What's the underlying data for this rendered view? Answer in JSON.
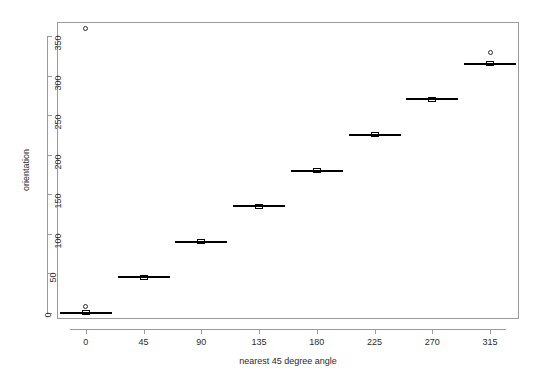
{
  "chart_data": {
    "type": "box",
    "title": "",
    "xlabel": "nearest 45 degree angle",
    "ylabel": "orientation",
    "categories": [
      "0",
      "45",
      "90",
      "135",
      "180",
      "225",
      "270",
      "315"
    ],
    "xlim": [
      -22.5,
      337.5
    ],
    "ylim": [
      -8,
      368
    ],
    "xticks": [
      "0",
      "45",
      "90",
      "135",
      "180",
      "225",
      "270",
      "315"
    ],
    "yticks": [
      "0",
      "50",
      "100",
      "150",
      "200",
      "250",
      "300",
      "350"
    ],
    "ytick_values": [
      0,
      50,
      100,
      150,
      200,
      250,
      300,
      350
    ],
    "grid": false,
    "legend": false,
    "boxes": [
      {
        "category": "0",
        "x": 0,
        "whisker_low": -3,
        "q1": -1,
        "median": 0,
        "q3": 1,
        "whisker_high": 3,
        "outliers": [
          360,
          8
        ]
      },
      {
        "category": "45",
        "x": 45,
        "whisker_low": 42,
        "q1": 44,
        "median": 45,
        "q3": 46,
        "whisker_high": 48,
        "outliers": []
      },
      {
        "category": "90",
        "x": 90,
        "whisker_low": 87,
        "q1": 89,
        "median": 90,
        "q3": 91,
        "whisker_high": 93,
        "outliers": []
      },
      {
        "category": "135",
        "x": 135,
        "whisker_low": 132,
        "q1": 134,
        "median": 135,
        "q3": 136,
        "whisker_high": 138,
        "outliers": []
      },
      {
        "category": "180",
        "x": 180,
        "whisker_low": 177,
        "q1": 179,
        "median": 180,
        "q3": 181,
        "whisker_high": 183,
        "outliers": []
      },
      {
        "category": "225",
        "x": 225,
        "whisker_low": 222,
        "q1": 224,
        "median": 225,
        "q3": 226,
        "whisker_high": 228,
        "outliers": []
      },
      {
        "category": "270",
        "x": 270,
        "whisker_low": 267,
        "q1": 269,
        "median": 270,
        "q3": 271,
        "whisker_high": 273,
        "outliers": []
      },
      {
        "category": "315",
        "x": 315,
        "whisker_low": 312,
        "q1": 314,
        "median": 315,
        "q3": 316,
        "whisker_high": 318,
        "outliers": [
          330
        ]
      }
    ],
    "colors": {
      "box_line": "#000000",
      "box_fill": "#ffffff",
      "median": "#000000",
      "whisker": "#000000",
      "outlier": "#2b2b2b",
      "axis": "#9a9a9a",
      "text": "#2b2b2b",
      "background": "#ffffff"
    }
  }
}
